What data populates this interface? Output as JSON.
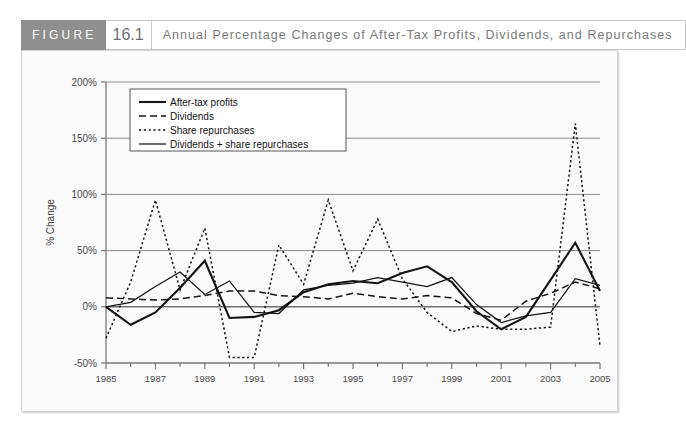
{
  "figure": {
    "word": "FIGURE",
    "number": "16.1",
    "title": "Annual Percentage Changes of After-Tax Profits, Dividends, and Repurchases",
    "header_bg": "#8f8f8f",
    "card_bg": "#fbfbfb"
  },
  "chart_data": {
    "type": "line",
    "title": "Annual Percentage Changes of After-Tax Profits, Dividends, and Repurchases",
    "xlabel": "",
    "ylabel": "% Change",
    "xlim": [
      1985,
      2005
    ],
    "ylim": [
      -50,
      200
    ],
    "yticks": [
      -50,
      0,
      50,
      100,
      150,
      200
    ],
    "ytick_labels": [
      "-50%",
      "0%",
      "50%",
      "100%",
      "150%",
      "200%"
    ],
    "xticks": [
      1985,
      1987,
      1989,
      1991,
      1993,
      1995,
      1997,
      1999,
      2001,
      2003,
      2005
    ],
    "xtick_labels": [
      "1985",
      "1987",
      "1989",
      "1991",
      "1993",
      "1995",
      "1997",
      "1999",
      "2001",
      "2003",
      "2005"
    ],
    "minor_xticks": [
      1986,
      1988,
      1990,
      1992,
      1994,
      1996,
      1998,
      2000,
      2002,
      2004
    ],
    "grid": true,
    "legend_position": "upper-left",
    "x": [
      1985,
      1986,
      1987,
      1988,
      1989,
      1990,
      1991,
      1992,
      1993,
      1994,
      1995,
      1996,
      1997,
      1998,
      1999,
      2000,
      2001,
      2002,
      2003,
      2004,
      2005
    ],
    "series": [
      {
        "name": "After-tax profits",
        "style": "solid-thick",
        "color": "#141414",
        "values": [
          0,
          -16,
          -5,
          17,
          41,
          -10,
          -9,
          -3,
          13,
          20,
          23,
          21,
          30,
          36,
          22,
          -4,
          -20,
          -9,
          24,
          57,
          14
        ]
      },
      {
        "name": "Dividends",
        "style": "dashed",
        "color": "#141414",
        "values": [
          8,
          7,
          6,
          7,
          10,
          14,
          14,
          10,
          9,
          7,
          12,
          9,
          7,
          10,
          8,
          -6,
          -12,
          5,
          12,
          22,
          16
        ]
      },
      {
        "name": "Share repurchases",
        "style": "dotted",
        "color": "#141414",
        "values": [
          -28,
          22,
          95,
          15,
          70,
          -45,
          -45,
          55,
          20,
          95,
          32,
          78,
          25,
          -5,
          -22,
          -17,
          -20,
          -20,
          -18,
          163,
          -35
        ]
      },
      {
        "name": "Dividends + share repurchases",
        "style": "solid-thin",
        "color": "#141414",
        "values": [
          0,
          4,
          18,
          31,
          11,
          23,
          -5,
          -6,
          15,
          19,
          21,
          26,
          22,
          18,
          26,
          2,
          -14,
          -8,
          -5,
          25,
          19
        ]
      }
    ],
    "legend": [
      "After-tax profits",
      "Dividends",
      "Share repurchases",
      "Dividends + share repurchases"
    ]
  }
}
